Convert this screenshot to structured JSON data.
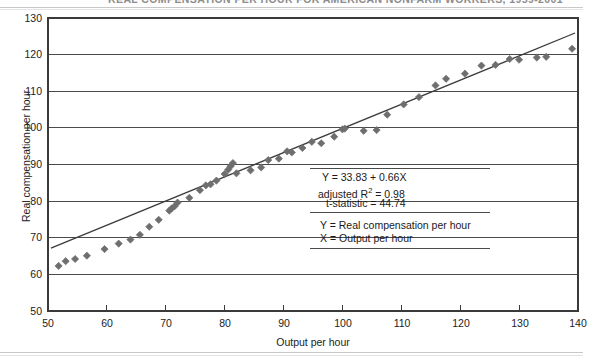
{
  "figure": {
    "title": "REAL COMPENSATION PER HOUR FOR AMERICAN NONFARM WORKERS, 1959-2001"
  },
  "annotation": {
    "equation_prefix": "Y = ",
    "equation": "Y = 33.83 + 0.66X",
    "r_squared_pre": "adjusted R",
    "r_squared_sup": "2",
    "r_squared_post": " = 0.98",
    "t_statistic": "t-statistic = 44.74",
    "legend_y": "Y = Real compensation per hour",
    "legend_x": "X = Output per hour"
  },
  "chart_data": {
    "type": "scatter",
    "title": "REAL COMPENSATION PER HOUR FOR AMERICAN NONFARM WORKERS, 1959-2001",
    "xlabel": "Output per hour",
    "ylabel": "Real compensation per hour",
    "xlim": [
      50,
      140
    ],
    "ylim": [
      50,
      130
    ],
    "xticks": [
      50,
      60,
      70,
      80,
      90,
      100,
      110,
      120,
      130,
      140
    ],
    "yticks": [
      50,
      60,
      70,
      80,
      90,
      100,
      110,
      120,
      130
    ],
    "grid": "horizontal",
    "legend": "none",
    "marker": "diamond",
    "marker_color": "#6e6e6e",
    "fit_line_color": "#3c3c3c",
    "fit_line": {
      "intercept": 33.83,
      "slope": 0.66,
      "adjusted_r_squared": 0.98,
      "t_statistic": 44.74,
      "x_from": 50.5,
      "x_to": 139.5
    },
    "points": [
      [
        51.8,
        62.3
      ],
      [
        53.0,
        63.6
      ],
      [
        54.6,
        64.2
      ],
      [
        56.6,
        65.1
      ],
      [
        59.6,
        66.9
      ],
      [
        62.0,
        68.4
      ],
      [
        64.0,
        69.5
      ],
      [
        65.6,
        70.8
      ],
      [
        67.2,
        73.0
      ],
      [
        68.8,
        74.9
      ],
      [
        70.6,
        77.4
      ],
      [
        71.0,
        78.0
      ],
      [
        71.5,
        78.6
      ],
      [
        72.0,
        79.6
      ],
      [
        74.0,
        80.9
      ],
      [
        75.8,
        83.0
      ],
      [
        76.8,
        84.3
      ],
      [
        77.6,
        84.6
      ],
      [
        78.6,
        85.6
      ],
      [
        80.0,
        87.4
      ],
      [
        80.6,
        88.6
      ],
      [
        81.0,
        89.5
      ],
      [
        81.4,
        90.4
      ],
      [
        82.0,
        87.6
      ],
      [
        84.4,
        88.4
      ],
      [
        86.2,
        89.2
      ],
      [
        87.4,
        91.2
      ],
      [
        89.2,
        91.6
      ],
      [
        90.6,
        93.6
      ],
      [
        91.4,
        93.3
      ],
      [
        93.2,
        94.5
      ],
      [
        94.8,
        96.2
      ],
      [
        96.4,
        95.8
      ],
      [
        98.6,
        97.6
      ],
      [
        100.0,
        99.6
      ],
      [
        100.4,
        99.8
      ],
      [
        103.6,
        99.2
      ],
      [
        105.8,
        99.4
      ],
      [
        107.6,
        103.6
      ],
      [
        110.4,
        106.4
      ],
      [
        113.0,
        108.4
      ],
      [
        115.8,
        111.6
      ],
      [
        117.6,
        113.4
      ],
      [
        120.8,
        114.8
      ],
      [
        123.6,
        117.0
      ],
      [
        126.0,
        117.2
      ],
      [
        128.4,
        118.8
      ],
      [
        130.0,
        118.6
      ],
      [
        133.0,
        119.2
      ],
      [
        134.6,
        119.4
      ],
      [
        139.0,
        121.6
      ]
    ]
  }
}
